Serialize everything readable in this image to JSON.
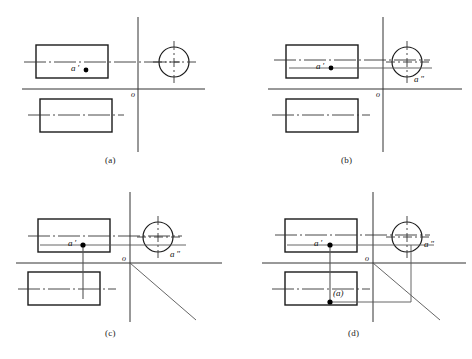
{
  "figure": {
    "bottom_caption": "",
    "colors": {
      "outline": "#1a1a1a",
      "thin_line": "#555555",
      "center_line": "#333333",
      "point_fill": "#000000",
      "background": "#ffffff"
    },
    "panels": [
      {
        "id": "a",
        "label": "(a)",
        "label_x": 112,
        "label_y": 160,
        "origin_x": 138,
        "origin_y": 89,
        "labels": {
          "origin": "o",
          "front_point": "a ′",
          "side_point": ""
        },
        "front_rect": {
          "x": 36,
          "y": 45,
          "w": 72,
          "h": 33
        },
        "top_rect": {
          "x": 40,
          "y": 99,
          "w": 72,
          "h": 33
        },
        "circle": {
          "cx": 174,
          "cy": 62,
          "r": 15
        },
        "a_prime": {
          "x": 86,
          "y": 70
        },
        "a_double": {
          "x": 0,
          "y": 0
        },
        "show_side_projection_line": false,
        "show_vertical_drop": false,
        "show_diagonal": false,
        "show_side_drop": false,
        "show_bottom_horizontal": false,
        "show_a_point": false
      },
      {
        "id": "b",
        "label": "(b)",
        "label_x": 348,
        "label_y": 160,
        "origin_x": 383,
        "origin_y": 89,
        "labels": {
          "origin": "o",
          "front_point": "a ′",
          "side_point": "a ″"
        },
        "front_rect": {
          "x": 286,
          "y": 45,
          "w": 72,
          "h": 33
        },
        "top_rect": {
          "x": 286,
          "y": 99,
          "w": 72,
          "h": 33
        },
        "circle": {
          "cx": 407,
          "cy": 62,
          "r": 15
        },
        "a_prime": {
          "x": 331,
          "y": 68
        },
        "a_double": {
          "x": 407,
          "y": 68
        },
        "show_side_projection_line": true,
        "show_vertical_drop": false,
        "show_diagonal": false,
        "show_side_drop": false,
        "show_bottom_horizontal": false,
        "show_a_point": false
      },
      {
        "id": "c",
        "label": "(c)",
        "label_x": 112,
        "label_y": 333,
        "origin_x": 130,
        "origin_y": 263,
        "labels": {
          "origin": "o",
          "front_point": "a ′",
          "side_point": "a ″",
          "top_point": ""
        },
        "front_rect": {
          "x": 38,
          "y": 219,
          "w": 72,
          "h": 33
        },
        "top_rect": {
          "x": 28,
          "y": 272,
          "w": 72,
          "h": 33
        },
        "circle": {
          "cx": 158,
          "cy": 237,
          "r": 15
        },
        "a_prime": {
          "x": 83,
          "y": 245
        },
        "a_double": {
          "x": 158,
          "y": 245
        },
        "show_side_projection_line": true,
        "show_vertical_drop": true,
        "show_diagonal": true,
        "show_side_drop": false,
        "show_bottom_horizontal": false,
        "show_a_point": false
      },
      {
        "id": "d",
        "label": "(d)",
        "label_x": 355,
        "label_y": 333,
        "origin_x": 373,
        "origin_y": 263,
        "labels": {
          "origin": "o",
          "front_point": "a ′",
          "side_point": "a ″",
          "top_point": "(a)"
        },
        "front_rect": {
          "x": 285,
          "y": 219,
          "w": 72,
          "h": 33
        },
        "top_rect": {
          "x": 285,
          "y": 272,
          "w": 72,
          "h": 33
        },
        "circle": {
          "cx": 407,
          "cy": 237,
          "r": 15
        },
        "a_prime": {
          "x": 330,
          "y": 245
        },
        "a_double": {
          "x": 407,
          "y": 245
        },
        "a_point": {
          "x": 330,
          "y": 302
        },
        "show_side_projection_line": true,
        "show_vertical_drop": true,
        "show_diagonal": true,
        "show_side_drop": true,
        "show_bottom_horizontal": true,
        "show_a_point": true
      }
    ]
  }
}
